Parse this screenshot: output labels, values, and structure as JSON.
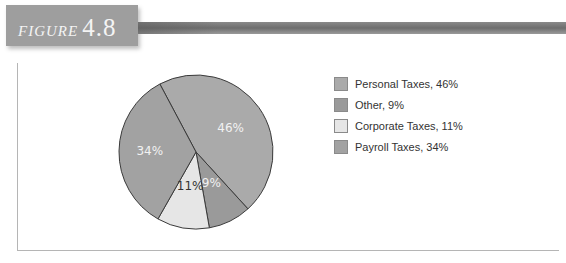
{
  "figure": {
    "word": "FIGURE",
    "number": "4.8"
  },
  "chart_data": {
    "type": "pie",
    "title": "",
    "slices": [
      {
        "name": "Personal Taxes",
        "value": 46,
        "label": "46%",
        "legend": "Personal Taxes, 46%",
        "color": "#aaaaaa"
      },
      {
        "name": "Other",
        "value": 9,
        "label": "9%",
        "legend": "Other, 9%",
        "color": "#9a9a9a"
      },
      {
        "name": "Corporate Taxes",
        "value": 11,
        "label": "11%",
        "legend": "Corporate Taxes, 11%",
        "color": "#e6e6e6"
      },
      {
        "name": "Payroll Taxes",
        "value": 34,
        "label": "34%",
        "legend": "Payroll Taxes, 34%",
        "color": "#a2a2a2"
      }
    ],
    "legend_position": "right"
  }
}
